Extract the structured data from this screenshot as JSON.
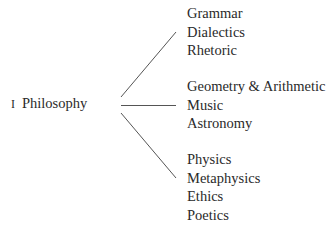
{
  "root": {
    "number": "I",
    "label": "Philosophy"
  },
  "branches": [
    {
      "items": [
        "Grammar",
        "Dialectics",
        "Rhetoric"
      ]
    },
    {
      "items": [
        "Geometry & Arithmetic",
        "Music",
        "Astronomy"
      ]
    },
    {
      "items": [
        "Physics",
        "Metaphysics",
        "Ethics",
        "Poetics"
      ]
    }
  ],
  "colors": {
    "text": "#2a2a2a",
    "line": "#555555",
    "background": "#ffffff"
  }
}
